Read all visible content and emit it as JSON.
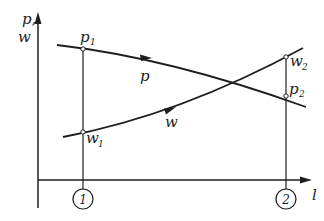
{
  "diagram": {
    "axes": {
      "y_label": [
        "p,",
        "w"
      ],
      "x_label": "l"
    },
    "curves": [
      {
        "name": "p",
        "label": "p",
        "trend": "decreasing",
        "start_point": {
          "label": "p",
          "sub": "1"
        },
        "end_point": {
          "label": "p",
          "sub": "2"
        }
      },
      {
        "name": "w",
        "label": "w",
        "trend": "increasing",
        "start_point": {
          "label": "w",
          "sub": "1"
        },
        "end_point": {
          "label": "w",
          "sub": "2"
        }
      }
    ],
    "sections": [
      {
        "id": "section-1",
        "number": "1"
      },
      {
        "id": "section-2",
        "number": "2"
      }
    ],
    "colors": {
      "ink": "#1e1e1e",
      "background": "#ffffff"
    }
  }
}
